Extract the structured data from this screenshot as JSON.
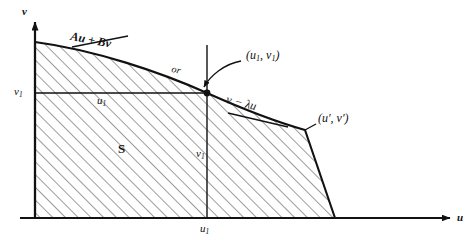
{
  "figure": {
    "type": "mathematical-diagram",
    "axes": {
      "vertical_label": "v",
      "horizontal_label": "u",
      "origin": [
        35,
        218
      ]
    },
    "region": {
      "name": "S",
      "fill": "diagonal-hatching",
      "hatch_color": "#3c3c3c"
    },
    "labels": {
      "v_axis": "v",
      "u_axis": "u",
      "v1_axis_tick": "v",
      "v1_axis_tick_sub": "1",
      "u1_axis_tick": "u",
      "u1_axis_tick_sub": "1",
      "u1_inner": "u",
      "u1_inner_sub": "1",
      "v1_inner": "v",
      "v1_inner_sub": "1",
      "region": "S",
      "boundary_expr_1": "Au + Bv",
      "or_text": "or",
      "boundary_expr_2": "v − λu",
      "point_1": "(u",
      "point_1_sub": "1",
      "point_1_mid": ", v",
      "point_1_sub2": "1",
      "point_1_end": ")",
      "point_2": "(u′, v′)"
    },
    "colors": {
      "stroke": "#111111",
      "hatch": "#4a4a4a",
      "background": "#ffffff"
    },
    "geometry": {
      "curve_start": [
        35,
        42
      ],
      "point_u1v1": [
        207,
        93
      ],
      "point_uprime_vprime": [
        305,
        130
      ],
      "curve_end_on_axis": [
        335,
        218
      ],
      "u_axis_end": [
        455,
        218
      ],
      "v_axis_top": [
        35,
        18
      ]
    }
  }
}
